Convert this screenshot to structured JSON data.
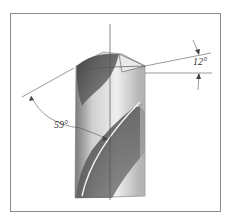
{
  "figure": {
    "annotations": {
      "lip_angle": "59°",
      "clearance_angle": "12°"
    },
    "colors": {
      "frame": "#8a8a8a",
      "line": "#444444",
      "shade_dark": "#555555",
      "shade_mid": "#9a9a9a",
      "shade_light": "#d8d8d8"
    }
  }
}
